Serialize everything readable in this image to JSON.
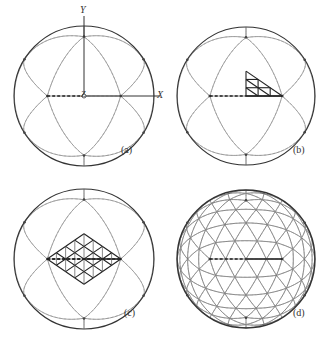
{
  "figure": {
    "colors": {
      "outline": "#333333",
      "solid_line": "#8a8a8a",
      "dashed_line": "#9a9a9a",
      "highlight": "#222222",
      "background": "#ffffff"
    },
    "panels": [
      {
        "id": "a",
        "label": "(a)",
        "cx": 84,
        "cy": 96,
        "r": 70,
        "label_x": 121,
        "label_y": 149,
        "show_axes": true,
        "subdivision": 1,
        "highlight": "none"
      },
      {
        "id": "b",
        "label": "(b)",
        "cx": 246,
        "cy": 96,
        "r": 69,
        "label_x": 293,
        "label_y": 149,
        "show_axes": false,
        "subdivision": 1,
        "highlight": "triangle"
      },
      {
        "id": "c",
        "label": "(c)",
        "cx": 84,
        "cy": 259,
        "r": 70,
        "label_x": 124,
        "label_y": 312,
        "show_axes": false,
        "subdivision": 1,
        "highlight": "rhombus"
      },
      {
        "id": "d",
        "label": "(d)",
        "cx": 246,
        "cy": 259,
        "r": 69,
        "label_x": 293,
        "label_y": 312,
        "show_axes": false,
        "subdivision": 4,
        "highlight": "none"
      }
    ],
    "axes": {
      "x_label": "X",
      "y_label": "Y",
      "z_label": "Z"
    }
  }
}
